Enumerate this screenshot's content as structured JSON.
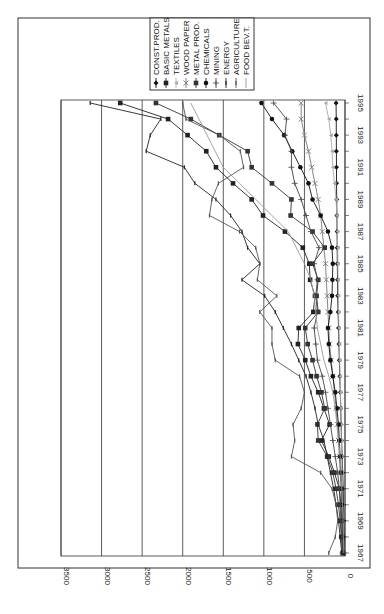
{
  "chart_data": {
    "type": "line",
    "orientation": "rotated-90-clockwise",
    "title": "",
    "xlabel": "",
    "ylabel": "",
    "x": [
      1967,
      1968,
      1969,
      1970,
      1971,
      1972,
      1973,
      1974,
      1975,
      1976,
      1977,
      1978,
      1979,
      1980,
      1981,
      1982,
      1983,
      1984,
      1985,
      1986,
      1987,
      1988,
      1989,
      1990,
      1991,
      1992,
      1993,
      1994,
      1995,
      1996
    ],
    "x_tick_labels": [
      "1967",
      "1969",
      "1971",
      "1973",
      "1975",
      "1977",
      "1979",
      "1981",
      "1983",
      "1985",
      "1987",
      "1989",
      "1991",
      "1993",
      "1995"
    ],
    "ylim": [
      0,
      3500
    ],
    "y_tick_labels": [
      "0",
      "500",
      "1000",
      "1500",
      "2000",
      "2500",
      "3000",
      "3500"
    ],
    "grid": true,
    "legend_position": "top-right",
    "series": [
      {
        "name": "CONST.PROD.",
        "color": "#111111",
        "marker": "diamond",
        "values": [
          10,
          12,
          15,
          18,
          22,
          28,
          35,
          42,
          48,
          52,
          58,
          64,
          70,
          75,
          80,
          85,
          90,
          92,
          95,
          96,
          98,
          100,
          102,
          104,
          105,
          106,
          107,
          108,
          110,
          110
        ]
      },
      {
        "name": "BASIC METALS",
        "color": "#222222",
        "marker": "square",
        "values": [
          20,
          30,
          40,
          50,
          70,
          130,
          200,
          290,
          190,
          260,
          330,
          420,
          490,
          580,
          570,
          390,
          370,
          430,
          440,
          520,
          740,
          1010,
          1150,
          1380,
          1590,
          1710,
          1940,
          2180,
          2770,
          3130
        ]
      },
      {
        "name": "TEXTILES",
        "color": "#aaaaaa",
        "marker": "triangle",
        "values": [
          15,
          20,
          25,
          28,
          32,
          36,
          40,
          45,
          48,
          52,
          56,
          60,
          65,
          70,
          75,
          78,
          82,
          85,
          88,
          90,
          95,
          100,
          110,
          130,
          150,
          160,
          175,
          200,
          240,
          290
        ]
      },
      {
        "name": "WOOD PAPER",
        "color": "#777777",
        "marker": "x",
        "values": [
          20,
          25,
          30,
          40,
          50,
          60,
          70,
          80,
          95,
          110,
          130,
          150,
          170,
          190,
          200,
          210,
          220,
          230,
          240,
          260,
          280,
          300,
          330,
          370,
          410,
          450,
          500,
          540,
          540,
          540
        ]
      },
      {
        "name": "METAL PROD.",
        "color": "#333333",
        "marker": "x-square",
        "values": [
          30,
          45,
          60,
          80,
          110,
          150,
          220,
          330,
          340,
          250,
          290,
          350,
          400,
          460,
          490,
          330,
          350,
          330,
          400,
          250,
          400,
          670,
          660,
          900,
          1150,
          1200,
          1550,
          1900,
          2330,
          2640
        ]
      },
      {
        "name": "CHEMICALS",
        "color": "#111111",
        "marker": "circle",
        "values": [
          20,
          25,
          30,
          35,
          40,
          50,
          60,
          70,
          80,
          100,
          120,
          150,
          180,
          200,
          210,
          180,
          160,
          155,
          150,
          160,
          210,
          300,
          400,
          450,
          550,
          650,
          750,
          900,
          1030,
          1030
        ]
      },
      {
        "name": "MINING",
        "color": "#444444",
        "marker": "plus",
        "values": [
          30,
          40,
          50,
          60,
          70,
          90,
          120,
          150,
          180,
          210,
          240,
          280,
          340,
          360,
          380,
          340,
          360,
          340,
          380,
          320,
          420,
          480,
          540,
          620,
          660,
          660,
          740,
          720,
          880,
          880
        ]
      },
      {
        "name": "ENERGY",
        "color": "#222222",
        "marker": "bar",
        "values": [
          40,
          60,
          80,
          110,
          140,
          180,
          220,
          260,
          330,
          370,
          420,
          480,
          570,
          660,
          760,
          860,
          990,
          1270,
          1050,
          1200,
          1270,
          1410,
          1590,
          1850,
          1980,
          2450,
          2400,
          2270,
          3140,
          3170
        ]
      },
      {
        "name": "AGRICULTURE",
        "color": "#555555",
        "marker": "bar",
        "values": [
          200,
          120,
          90,
          110,
          160,
          300,
          660,
          620,
          640,
          540,
          500,
          560,
          860,
          900,
          900,
          1050,
          840,
          1080,
          1050,
          1100,
          1300,
          1670,
          1640,
          1560,
          1250,
          1290,
          1550,
          1960,
          2000,
          2000
        ]
      },
      {
        "name": "FOOD BEV.T.",
        "color": "#999999",
        "marker": "none",
        "values": [
          15,
          20,
          25,
          30,
          40,
          50,
          60,
          80,
          100,
          120,
          150,
          200,
          260,
          300,
          340,
          360,
          380,
          420,
          500,
          600,
          700,
          900,
          1100,
          1300,
          1500,
          1600,
          1700,
          1800,
          1900,
          1950
        ]
      }
    ]
  }
}
